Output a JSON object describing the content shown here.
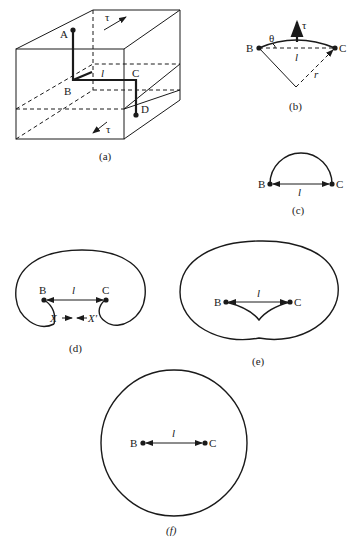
{
  "figure": {
    "panels": [
      {
        "id": "a",
        "caption": "(a)",
        "labels": {
          "A": "A",
          "B": "B",
          "C": "C",
          "D": "D",
          "l": "l",
          "tau_top": "τ",
          "tau_bottom": "τ"
        },
        "description": "Dislocation line ABCD in a crystal block with shear stress τ on top and bottom faces"
      },
      {
        "id": "b",
        "caption": "(b)",
        "labels": {
          "B": "B",
          "C": "C",
          "theta": "θ",
          "l": "l",
          "r": "r",
          "tau": "τ"
        },
        "description": "Segment BC bowing out into arc of radius r under stress τ"
      },
      {
        "id": "c",
        "caption": "(c)",
        "labels": {
          "B": "B",
          "C": "C",
          "l": "l"
        },
        "description": "Semicircular configuration of dislocation loop between B and C"
      },
      {
        "id": "d",
        "caption": "(d)",
        "labels": {
          "B": "B",
          "C": "C",
          "l": "l",
          "X": "X",
          "X_prime": "X′"
        },
        "description": "Loop expanding around pinning points; segments X and X′ approach each other"
      },
      {
        "id": "e",
        "caption": "(e)",
        "labels": {
          "B": "B",
          "C": "C",
          "l": "l"
        },
        "description": "Segments annihilate, forming large loop and regenerated segment BC"
      },
      {
        "id": "f",
        "caption": "(f)",
        "labels": {
          "B": "B",
          "C": "C",
          "l": "l"
        },
        "description": "Closed loop released, with new segment BC restored"
      }
    ]
  }
}
